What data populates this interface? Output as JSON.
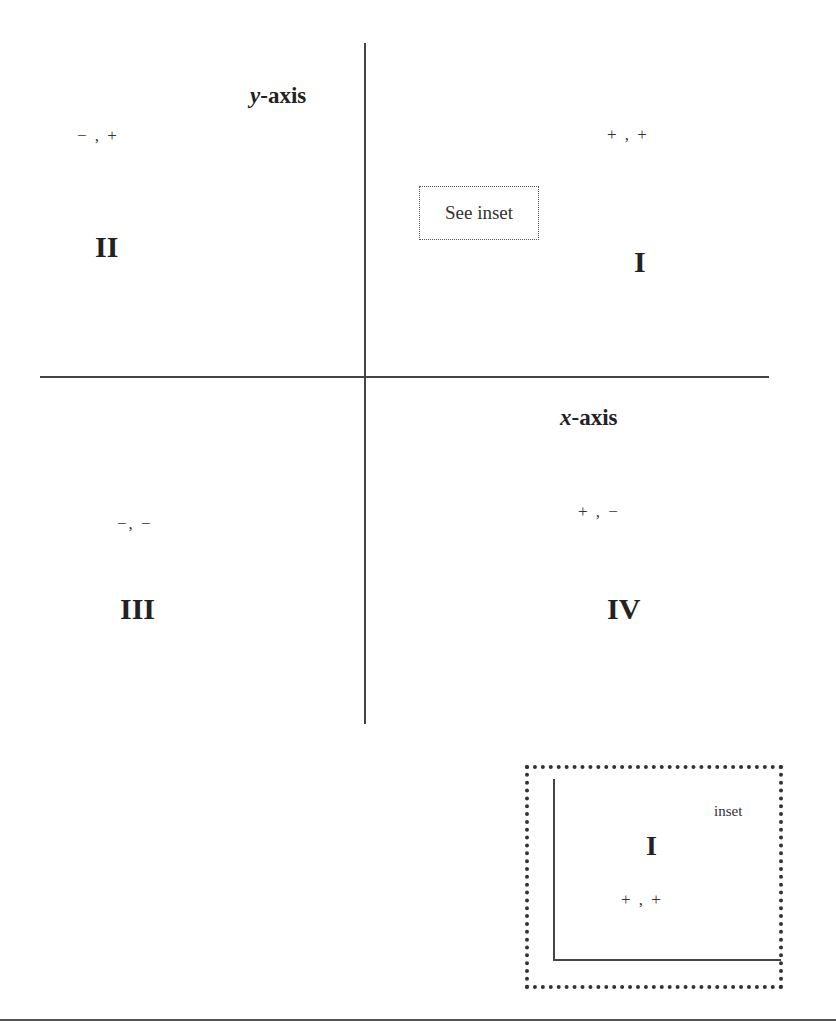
{
  "diagram": {
    "axes": {
      "y_label_var": "y",
      "y_label_suffix": "-axis",
      "x_label_var": "x",
      "x_label_suffix": "-axis"
    },
    "quadrants": [
      {
        "numeral": "I",
        "signs": "+ , +"
      },
      {
        "numeral": "II",
        "signs": "− , +"
      },
      {
        "numeral": "III",
        "signs": "−, −"
      },
      {
        "numeral": "IV",
        "signs": "+ , −"
      }
    ],
    "callout": {
      "label": "See inset"
    },
    "inset": {
      "label": "inset",
      "numeral": "I",
      "signs": "+ , +"
    },
    "colors": {
      "line": "#444444",
      "text": "#222222",
      "background": "#ffffff"
    }
  }
}
